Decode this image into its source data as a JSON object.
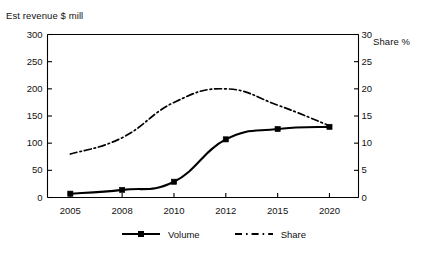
{
  "chart_data": {
    "type": "line",
    "title": "",
    "xlabel": "",
    "ylabel": "Est revenue $ mill",
    "ylabel_right": "Share %",
    "categories": [
      "2005",
      "2008",
      "2010",
      "2012",
      "2015",
      "2020"
    ],
    "ylim": [
      0,
      300
    ],
    "yticks": [
      "0",
      "50",
      "100",
      "150",
      "200",
      "250",
      "300"
    ],
    "ylim_right": [
      0,
      30
    ],
    "yticks_right": [
      "0",
      "5",
      "10",
      "15",
      "20",
      "25",
      "30"
    ],
    "grid": false,
    "legend_position": "bottom-center",
    "series": [
      {
        "name": "Volume",
        "axis": "left",
        "style": "solid",
        "marker": "square",
        "values": [
          7,
          14,
          29,
          107,
          126,
          130
        ]
      },
      {
        "name": "Share",
        "axis": "right",
        "style": "dash-dot",
        "marker": "none",
        "values": [
          8,
          11,
          17.5,
          20,
          17,
          13.2
        ]
      }
    ]
  },
  "axes": {
    "left_title": "Est revenue $ mill",
    "right_title": "Share %"
  },
  "legend": {
    "items": [
      {
        "label": "Volume"
      },
      {
        "label": "Share"
      }
    ]
  }
}
